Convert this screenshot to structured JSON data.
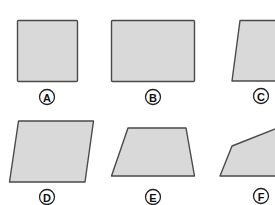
{
  "colors": {
    "fill": "#d9d9d9",
    "stroke": "#4a4a4a",
    "label_stroke": "#222222"
  },
  "figures": [
    {
      "id": "A",
      "label": "A",
      "kind": "square"
    },
    {
      "id": "B",
      "label": "B",
      "kind": "rectangle"
    },
    {
      "id": "C",
      "label": "C",
      "kind": "trapezoid-slanted-left"
    },
    {
      "id": "D",
      "label": "D",
      "kind": "parallelogram"
    },
    {
      "id": "E",
      "label": "E",
      "kind": "trapezoid"
    },
    {
      "id": "F",
      "label": "F",
      "kind": "irregular-polygon"
    }
  ]
}
